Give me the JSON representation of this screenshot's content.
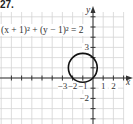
{
  "problem_number": "27.",
  "chart_data": {
    "type": "line",
    "title": "",
    "equation": "(x + 1)² + (y − 1)² = 2",
    "shape": "circle",
    "center": [
      -1,
      1
    ],
    "radius": 1.4142,
    "xlabel": "x",
    "ylabel": "y",
    "xlim": [
      -9,
      3.8
    ],
    "ylim": [
      -4.2,
      7
    ],
    "grid": true,
    "x_ticks": [
      -8,
      -7,
      -6,
      -5,
      -4,
      -3,
      -2,
      -1,
      1,
      2,
      3
    ],
    "y_ticks": [
      -4,
      -3,
      -2,
      -1,
      1,
      2,
      3,
      4,
      5,
      6
    ],
    "x_tick_labels": [
      {
        "value": -3,
        "text": "−3"
      },
      {
        "value": -2,
        "text": "−2"
      },
      {
        "value": -1,
        "text": "−1"
      },
      {
        "value": 1,
        "text": "1"
      },
      {
        "value": 2,
        "text": "2"
      }
    ],
    "y_tick_labels": [
      {
        "value": 3,
        "text": "3"
      },
      {
        "value": -2,
        "text": "−2"
      }
    ]
  },
  "colors": {
    "grid": "#d4d4d4",
    "axis": "#333333",
    "curve": "#111111"
  }
}
